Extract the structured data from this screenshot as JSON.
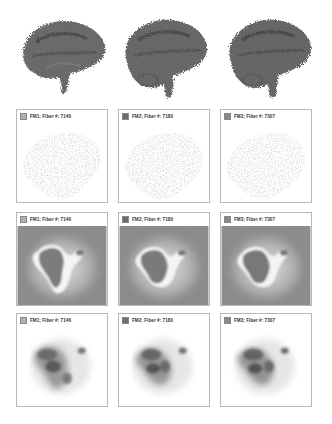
{
  "figure": {
    "columns": [
      {
        "id": "FM1",
        "label": "FM1; Fiber #: 7146",
        "swatch_color": "#b0b0b0"
      },
      {
        "id": "FM2",
        "label": "FM2; Fiber #: 7180",
        "swatch_color": "#6e6e6e"
      },
      {
        "id": "FM3",
        "label": "FM3; Fiber #: 7307",
        "swatch_color": "#8a8a8a"
      }
    ],
    "rows": [
      {
        "id": "row-1",
        "type": "3d-fiber-tract-render",
        "description": "brain fiber tractography, sagittal view"
      },
      {
        "id": "row-2",
        "type": "fiber-scatter-projection"
      },
      {
        "id": "row-3",
        "type": "distance-field-map"
      },
      {
        "id": "row-4",
        "type": "density-map"
      }
    ],
    "colors": {
      "fiber": "#6a6a6a",
      "scatter": "#a8a8a8",
      "panel_border": "#b8b8b8",
      "distance_bg": "#8c8c8c",
      "density_dark": "#4a4a4a"
    }
  }
}
